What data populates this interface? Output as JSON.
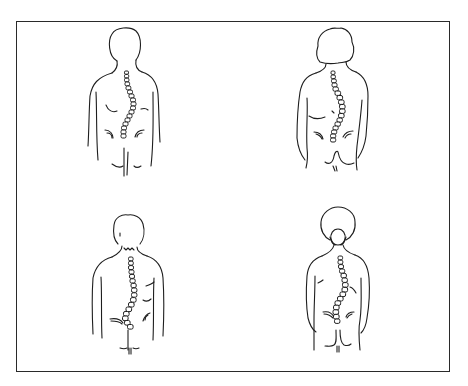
{
  "illustration": {
    "subject": "Four back-view figures showing curved spines (scoliosis)",
    "frame_color": "#2a2a2a",
    "line_color": "#1e1e1e",
    "background": "#ffffff",
    "figures": [
      {
        "position": "top-left",
        "label": "figure-1",
        "curve": "right thoracic, left lumbar"
      },
      {
        "position": "top-right",
        "label": "figure-2",
        "curve": "right thoracic, left lumbar"
      },
      {
        "position": "bottom-left",
        "label": "figure-3",
        "curve": "right thoracolumbar"
      },
      {
        "position": "bottom-right",
        "label": "figure-4",
        "curve": "right thoracic, left lumbar"
      }
    ]
  }
}
